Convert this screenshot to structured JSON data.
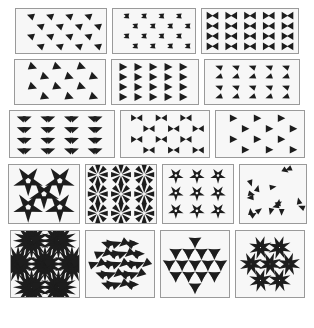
{
  "figure": {
    "background_color": "#ffffff",
    "panel_border_color": "#9a9a9a",
    "panel_fill_color": "#f7f7f7",
    "motif_color": "#1d1d1d",
    "panel_count": 17,
    "row_layout": [
      3,
      3,
      3,
      4,
      4
    ]
  },
  "rows": [
    {
      "row_label": "row-1",
      "panels": [
        {
          "id": "p1",
          "name": "sparse-left-triangles",
          "width": 92,
          "height": 46,
          "pattern": "grid-triangles",
          "cols": 4,
          "rows": 4,
          "rotation": 200,
          "scale": 1.0,
          "stagger": 0.5,
          "jitter": 0.0
        },
        {
          "id": "p2",
          "name": "paired-arrow-triangles",
          "width": 84,
          "height": 46,
          "pattern": "pair-arrows",
          "cols": 4,
          "rows": 4,
          "rotation": 200,
          "scale": 0.85,
          "stagger": 0.5,
          "jitter": 0.0
        },
        {
          "id": "p3",
          "name": "dense-opposed-triangles",
          "width": 98,
          "height": 46,
          "pattern": "opposed-rows",
          "cols": 5,
          "rows": 4,
          "rotation": 0,
          "scale": 1.0,
          "stagger": 0.0,
          "jitter": 0.0
        }
      ]
    },
    {
      "row_label": "row-2",
      "panels": [
        {
          "id": "p4",
          "name": "staggered-right-triangles",
          "width": 92,
          "height": 46,
          "pattern": "grid-triangles",
          "cols": 3,
          "rows": 4,
          "rotation": 20,
          "scale": 1.15,
          "stagger": 0.5,
          "jitter": 0.0
        },
        {
          "id": "p5",
          "name": "uniform-right-triangles",
          "width": 88,
          "height": 46,
          "pattern": "grid-triangles",
          "cols": 5,
          "rows": 4,
          "rotation": 0,
          "scale": 1.1,
          "stagger": 0.0,
          "jitter": 0.0
        },
        {
          "id": "p6",
          "name": "alternating-thin-triangles",
          "width": 96,
          "height": 46,
          "pattern": "alt-flip",
          "cols": 5,
          "rows": 4,
          "rotation": 10,
          "scale": 0.9,
          "stagger": 0.0,
          "jitter": 0.0
        }
      ]
    },
    {
      "row_label": "row-3",
      "panels": [
        {
          "id": "p7",
          "name": "chevron-zigzag-rows",
          "width": 106,
          "height": 48,
          "pattern": "chevron-rows",
          "cols": 4,
          "rows": 4,
          "rotation": 0,
          "scale": 1.0,
          "stagger": 0.0,
          "jitter": 0.0
        },
        {
          "id": "p8",
          "name": "bowtie-offset-grid",
          "width": 90,
          "height": 48,
          "pattern": "bowtie",
          "cols": 3,
          "rows": 4,
          "rotation": 0,
          "scale": 1.0,
          "stagger": 0.5,
          "jitter": 0.0
        },
        {
          "id": "p9",
          "name": "sparse-right-triangles",
          "width": 90,
          "height": 48,
          "pattern": "grid-triangles",
          "cols": 3,
          "rows": 4,
          "rotation": 0,
          "scale": 1.0,
          "stagger": 0.5,
          "jitter": 0.0
        }
      ]
    },
    {
      "row_label": "row-4",
      "panels": [
        {
          "id": "p10",
          "name": "sparse-pinwheels",
          "width": 72,
          "height": 60,
          "pattern": "pinwheel-grid",
          "cols": 2,
          "rows": 2,
          "blades": 5,
          "scale": 1.0,
          "stagger": 0.5,
          "center": true
        },
        {
          "id": "p11",
          "name": "dense-asterisk-stars",
          "width": 72,
          "height": 60,
          "pattern": "star-grid",
          "cols": 3,
          "rows": 3,
          "blades": 8,
          "scale": 1.0,
          "stagger": 0.0,
          "center": false
        },
        {
          "id": "p12",
          "name": "pinwheel-grid",
          "width": 72,
          "height": 60,
          "pattern": "pinwheel-grid",
          "cols": 3,
          "rows": 3,
          "blades": 5,
          "scale": 0.78,
          "stagger": 0.0,
          "center": false
        },
        {
          "id": "p13",
          "name": "scattered-random-triangles",
          "width": 68,
          "height": 60,
          "pattern": "scatter",
          "count": 17,
          "scale": 0.9,
          "jitter": 1.0
        }
      ]
    },
    {
      "row_label": "row-5",
      "panels": [
        {
          "id": "p14",
          "name": "hexagonal-rosette-flower",
          "width": 70,
          "height": 68,
          "pattern": "rosette-flower",
          "rosettes": 7,
          "blades": 16,
          "scale": 1.0
        },
        {
          "id": "p15",
          "name": "triangular-cluster-hex",
          "width": 70,
          "height": 68,
          "pattern": "tri-cluster",
          "rings": 3,
          "blades": 3,
          "scale": 1.0
        },
        {
          "id": "p16",
          "name": "nested-triangle-motifs",
          "width": 70,
          "height": 68,
          "pattern": "nested-tri",
          "rings": 3,
          "blades": 3,
          "scale": 1.0
        },
        {
          "id": "p17",
          "name": "pinwheel-rosette-cluster",
          "width": 70,
          "height": 68,
          "pattern": "pinwheel-cluster",
          "rosettes": 7,
          "blades": 8,
          "scale": 1.0
        }
      ]
    }
  ]
}
